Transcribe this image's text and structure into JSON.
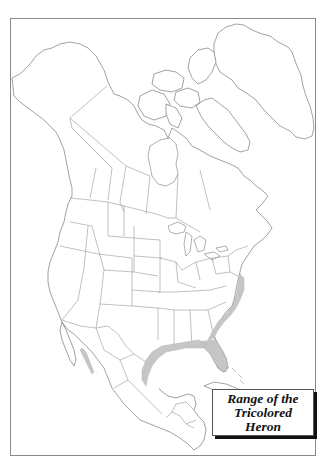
{
  "map": {
    "title_lines": [
      "Range of the",
      "Tricolored",
      "Heron"
    ],
    "region": "North America",
    "species": "Tricolored Heron",
    "colors": {
      "background": "#ffffff",
      "frame": "#8a8a8a",
      "outline": "#7a7a7a",
      "range_fill": "#c4c4c4",
      "legend_shadow": "#111111"
    },
    "range_areas": [
      "Atlantic coast (New Jersey to Florida)",
      "Gulf of Mexico coast (Florida to Texas and eastern Mexico)",
      "Pacific coast of northwestern Mexico"
    ]
  }
}
